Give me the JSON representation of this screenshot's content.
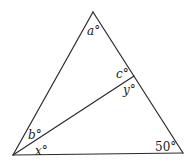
{
  "diagram": {
    "type": "triangle-with-cevian",
    "vertices": {
      "apex": {
        "x": 93,
        "y": 12
      },
      "bottom_left": {
        "x": 13,
        "y": 155
      },
      "bottom_right": {
        "x": 183,
        "y": 153
      },
      "cevian_end": {
        "x": 134,
        "y": 77
      }
    },
    "angle_labels": {
      "a": {
        "var": "a",
        "deg": "°"
      },
      "b": {
        "var": "b",
        "deg": "°"
      },
      "c": {
        "var": "c",
        "deg": "°"
      },
      "x": {
        "var": "x",
        "deg": "°"
      },
      "y": {
        "var": "y",
        "deg": "°"
      },
      "fifty": {
        "text": "50°"
      }
    }
  }
}
